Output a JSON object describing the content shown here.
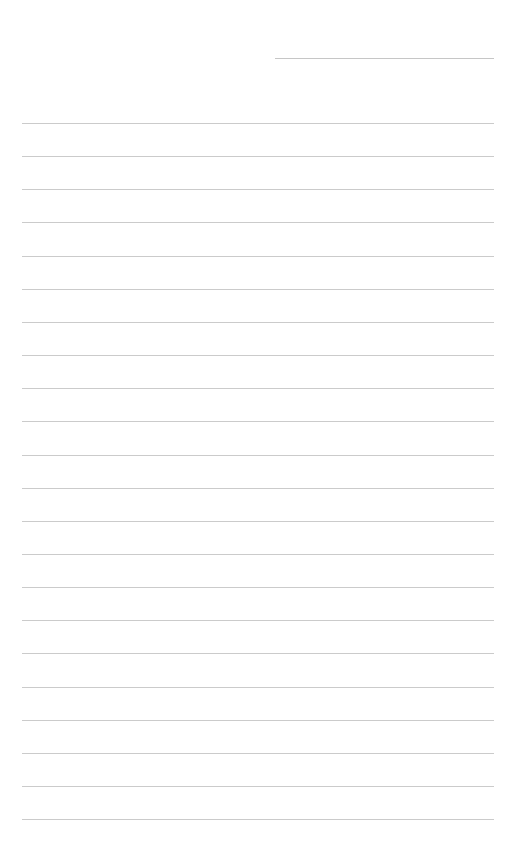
{
  "page": {
    "type": "blank ruled sheet",
    "background": "#ffffff",
    "line_color": "#cbcbcb",
    "header_line": {
      "text": ""
    },
    "lines": [
      "",
      "",
      "",
      "",
      "",
      "",
      "",
      "",
      "",
      "",
      "",
      "",
      "",
      "",
      "",
      "",
      "",
      "",
      "",
      "",
      "",
      ""
    ]
  }
}
